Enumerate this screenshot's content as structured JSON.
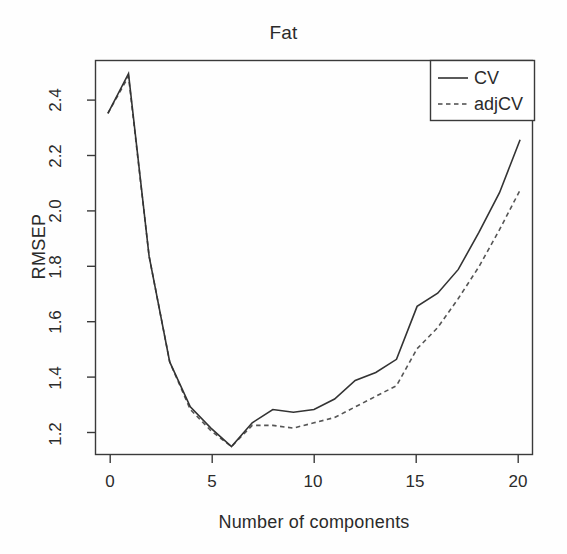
{
  "chart_data": {
    "type": "line",
    "title": "Fat",
    "xlabel": "Number of components",
    "ylabel": "RMSEP",
    "xlim": [
      -0.6,
      20.6
    ],
    "ylim": [
      1.09,
      2.58
    ],
    "grid": false,
    "legend_position": "top-right",
    "xticks": [
      "0",
      "5",
      "10",
      "15",
      "20"
    ],
    "xtick_values": [
      0,
      5,
      10,
      15,
      20
    ],
    "yticks": [
      "1.2",
      "1.4",
      "1.6",
      "1.8",
      "2.0",
      "2.2",
      "2.4"
    ],
    "ytick_values": [
      1.2,
      1.4,
      1.6,
      1.8,
      2.0,
      2.2,
      2.4
    ],
    "x": [
      0,
      1,
      2,
      3,
      4,
      5,
      6,
      7,
      8,
      9,
      10,
      11,
      12,
      13,
      14,
      15,
      16,
      17,
      18,
      19,
      20
    ],
    "series": [
      {
        "name": "CV",
        "style": "solid",
        "color": "#333333",
        "values": [
          2.38,
          2.53,
          1.84,
          1.44,
          1.27,
          1.19,
          1.12,
          1.21,
          1.26,
          1.25,
          1.26,
          1.3,
          1.37,
          1.4,
          1.45,
          1.65,
          1.7,
          1.79,
          1.93,
          2.08,
          2.28
        ]
      },
      {
        "name": "adjCV",
        "style": "dashed",
        "color": "#555555",
        "values": [
          2.38,
          2.52,
          1.84,
          1.44,
          1.26,
          1.18,
          1.12,
          1.2,
          1.2,
          1.19,
          1.21,
          1.23,
          1.27,
          1.31,
          1.35,
          1.49,
          1.57,
          1.68,
          1.8,
          1.94,
          2.09
        ]
      }
    ]
  },
  "legend": {
    "entries": [
      {
        "label": "CV",
        "style": "solid"
      },
      {
        "label": "adjCV",
        "style": "dashed"
      }
    ]
  }
}
